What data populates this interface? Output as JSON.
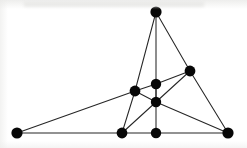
{
  "figure": {
    "canvas": {
      "width": 247,
      "height": 148
    },
    "style": {
      "background_color": "#ffffff",
      "edge_color": "#262626",
      "vertex_color": "#070707",
      "edge_width": 1.05,
      "vertex_radius": 5.2
    }
  },
  "chart_data": {
    "type": "diagram",
    "subtype": "node-link-graph",
    "directed": false,
    "weighted": false,
    "vertex_count": 9,
    "edge_count": 16,
    "xlabel": "",
    "ylabel": "",
    "xlim": [
      0,
      247
    ],
    "ylim": [
      0,
      148
    ],
    "grid": false,
    "legend": null,
    "nodes": [
      {
        "id": "A",
        "label": "",
        "x": 156,
        "y": 12,
        "r": 5.6,
        "role": "top-apex"
      },
      {
        "id": "B",
        "label": "",
        "x": 190,
        "y": 71,
        "r": 5.4,
        "role": "right-upper"
      },
      {
        "id": "C",
        "label": "",
        "x": 135,
        "y": 91,
        "r": 5.4,
        "role": "left-middle"
      },
      {
        "id": "D",
        "label": "",
        "x": 156,
        "y": 84,
        "r": 5.2,
        "role": "center-upper"
      },
      {
        "id": "E",
        "label": "",
        "x": 156,
        "y": 102,
        "r": 5.2,
        "role": "center-lower"
      },
      {
        "id": "F",
        "label": "",
        "x": 17,
        "y": 133,
        "r": 5.6,
        "role": "bottom-left"
      },
      {
        "id": "G",
        "label": "",
        "x": 122,
        "y": 133,
        "r": 5.4,
        "role": "bottom-mid-left"
      },
      {
        "id": "H",
        "label": "",
        "x": 156,
        "y": 133,
        "r": 5.2,
        "role": "bottom-mid-right"
      },
      {
        "id": "I",
        "label": "",
        "x": 228,
        "y": 133,
        "r": 5.6,
        "role": "bottom-right"
      }
    ],
    "edges": [
      {
        "source": "A",
        "target": "C"
      },
      {
        "source": "A",
        "target": "H"
      },
      {
        "source": "A",
        "target": "B"
      },
      {
        "source": "B",
        "target": "D"
      },
      {
        "source": "B",
        "target": "E"
      },
      {
        "source": "B",
        "target": "I"
      },
      {
        "source": "C",
        "target": "D"
      },
      {
        "source": "C",
        "target": "E"
      },
      {
        "source": "C",
        "target": "F"
      },
      {
        "source": "C",
        "target": "G"
      },
      {
        "source": "E",
        "target": "G"
      },
      {
        "source": "E",
        "target": "I"
      },
      {
        "source": "F",
        "target": "G"
      },
      {
        "source": "G",
        "target": "H"
      },
      {
        "source": "H",
        "target": "I"
      },
      {
        "source": "D",
        "target": "E"
      }
    ]
  }
}
